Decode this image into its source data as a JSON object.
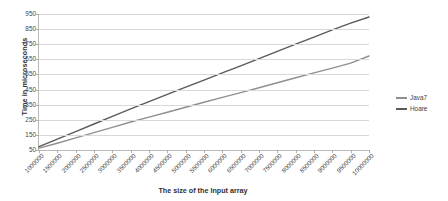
{
  "chart_data": {
    "type": "line",
    "title": "",
    "xlabel": "The size of the Input array",
    "ylabel": "Time in microseconds",
    "xlim": [
      1000000,
      10000000
    ],
    "ylim": [
      50,
      950
    ],
    "grid": true,
    "legend_position": "right",
    "x": [
      1000000,
      1500000,
      2000000,
      2500000,
      3000000,
      3500000,
      4000000,
      4500000,
      5000000,
      5500000,
      6000000,
      6500000,
      7000000,
      7500000,
      8000000,
      8500000,
      9000000,
      9500000,
      10000000
    ],
    "xtick_labels": [
      "1000000",
      "1500000",
      "2000000",
      "2500000",
      "3000000",
      "3500000",
      "4000000",
      "4500000",
      "5000000",
      "5500000",
      "6000000",
      "6500000",
      "7000000",
      "7500000",
      "8000000",
      "8500000",
      "9000000",
      "9500000",
      "10000000"
    ],
    "ytick_labels": [
      "950",
      "850",
      "750",
      "650",
      "550",
      "450",
      "350",
      "250",
      "150",
      "50"
    ],
    "ytick_values": [
      950,
      850,
      750,
      650,
      550,
      450,
      350,
      250,
      150,
      50
    ],
    "series": [
      {
        "name": "Java7",
        "color": "#8f8f8f",
        "values": [
          62,
          95,
          130,
          165,
          200,
          235,
          268,
          300,
          333,
          366,
          398,
          430,
          462,
          495,
          528,
          560,
          592,
          625,
          672
        ]
      },
      {
        "name": "Hoare",
        "color": "#5a5a5a",
        "values": [
          72,
          122,
          172,
          222,
          272,
          322,
          370,
          418,
          466,
          513,
          560,
          607,
          655,
          703,
          750,
          797,
          845,
          890,
          930
        ]
      }
    ]
  },
  "legend": {
    "entries": [
      {
        "label": "Java7",
        "color": "#8f8f8f"
      },
      {
        "label": "Hoare",
        "color": "#5a5a5a"
      }
    ]
  },
  "axes": {
    "y_title": "Time in microseconds",
    "x_title": "The size of the Input array"
  },
  "colors": {
    "background": "#ffffff",
    "gridline": "#d8d8d8",
    "axis": "#b9b9b9",
    "text": "#454545"
  }
}
